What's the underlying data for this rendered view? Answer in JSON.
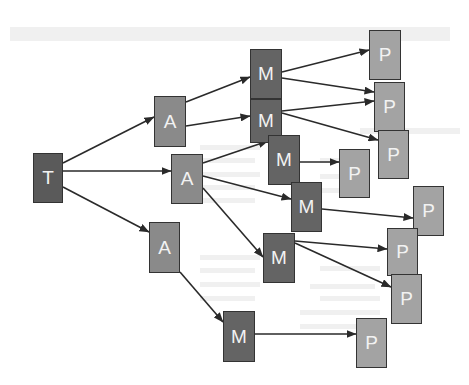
{
  "diagram": {
    "type": "tree-flow",
    "colors": {
      "T": "#5a5a5a",
      "A": "#8a8a8a",
      "M": "#646464",
      "P": "#a3a3a3",
      "border": "#333333",
      "edge": "#2a2a2a",
      "label": "#f2f2f2"
    },
    "nodes": [
      {
        "id": "T",
        "label": "T",
        "kind": "T",
        "x": 33,
        "y": 153,
        "w": 30,
        "h": 50
      },
      {
        "id": "A1",
        "label": "A",
        "kind": "A",
        "x": 154,
        "y": 96,
        "w": 32,
        "h": 51
      },
      {
        "id": "A2",
        "label": "A",
        "kind": "A",
        "x": 171,
        "y": 154,
        "w": 32,
        "h": 50
      },
      {
        "id": "A3",
        "label": "A",
        "kind": "A",
        "x": 149,
        "y": 222,
        "w": 31,
        "h": 51
      },
      {
        "id": "M1",
        "label": "M",
        "kind": "M",
        "x": 250,
        "y": 49,
        "w": 32,
        "h": 50
      },
      {
        "id": "M2",
        "label": "M",
        "kind": "M",
        "x": 250,
        "y": 99,
        "w": 32,
        "h": 44
      },
      {
        "id": "M3",
        "label": "M",
        "kind": "M",
        "x": 268,
        "y": 135,
        "w": 32,
        "h": 50
      },
      {
        "id": "M4",
        "label": "M",
        "kind": "M",
        "x": 291,
        "y": 182,
        "w": 31,
        "h": 50
      },
      {
        "id": "M5",
        "label": "M",
        "kind": "M",
        "x": 263,
        "y": 233,
        "w": 32,
        "h": 50
      },
      {
        "id": "M6",
        "label": "M",
        "kind": "M",
        "x": 223,
        "y": 311,
        "w": 32,
        "h": 51
      },
      {
        "id": "P1",
        "label": "P",
        "kind": "P",
        "x": 369,
        "y": 30,
        "w": 32,
        "h": 50
      },
      {
        "id": "P2",
        "label": "P",
        "kind": "P",
        "x": 374,
        "y": 82,
        "w": 31,
        "h": 50
      },
      {
        "id": "P3",
        "label": "P",
        "kind": "P",
        "x": 378,
        "y": 130,
        "w": 31,
        "h": 49
      },
      {
        "id": "P4",
        "label": "P",
        "kind": "P",
        "x": 339,
        "y": 149,
        "w": 31,
        "h": 49
      },
      {
        "id": "P5",
        "label": "P",
        "kind": "P",
        "x": 413,
        "y": 186,
        "w": 31,
        "h": 50
      },
      {
        "id": "P6",
        "label": "P",
        "kind": "P",
        "x": 387,
        "y": 228,
        "w": 31,
        "h": 48
      },
      {
        "id": "P7",
        "label": "P",
        "kind": "P",
        "x": 391,
        "y": 274,
        "w": 31,
        "h": 50
      },
      {
        "id": "P8",
        "label": "P",
        "kind": "P",
        "x": 356,
        "y": 318,
        "w": 31,
        "h": 50
      }
    ],
    "edges": [
      {
        "from": "T",
        "to": "A1",
        "x1": 63,
        "y1": 163,
        "x2": 154,
        "y2": 117
      },
      {
        "from": "T",
        "to": "A2",
        "x1": 63,
        "y1": 171,
        "x2": 171,
        "y2": 171
      },
      {
        "from": "T",
        "to": "A3",
        "x1": 63,
        "y1": 187,
        "x2": 149,
        "y2": 232
      },
      {
        "from": "A1",
        "to": "M1",
        "x1": 186,
        "y1": 102,
        "x2": 250,
        "y2": 77
      },
      {
        "from": "A1",
        "to": "M2",
        "x1": 186,
        "y1": 126,
        "x2": 250,
        "y2": 116
      },
      {
        "from": "A2",
        "to": "M3",
        "x1": 203,
        "y1": 163,
        "x2": 268,
        "y2": 141
      },
      {
        "from": "A2",
        "to": "M4",
        "x1": 203,
        "y1": 176,
        "x2": 291,
        "y2": 199
      },
      {
        "from": "A2",
        "to": "M5",
        "x1": 203,
        "y1": 188,
        "x2": 263,
        "y2": 257
      },
      {
        "from": "A3",
        "to": "M6",
        "x1": 180,
        "y1": 272,
        "x2": 223,
        "y2": 322
      },
      {
        "from": "M1",
        "to": "P1",
        "x1": 282,
        "y1": 72,
        "x2": 369,
        "y2": 50
      },
      {
        "from": "M1",
        "to": "P2",
        "x1": 282,
        "y1": 78,
        "x2": 374,
        "y2": 92
      },
      {
        "from": "M2",
        "to": "P2",
        "x1": 282,
        "y1": 111,
        "x2": 374,
        "y2": 101
      },
      {
        "from": "M2",
        "to": "P3",
        "x1": 282,
        "y1": 113,
        "x2": 378,
        "y2": 140
      },
      {
        "from": "M3",
        "to": "P4",
        "x1": 300,
        "y1": 162,
        "x2": 339,
        "y2": 162
      },
      {
        "from": "M4",
        "to": "P5",
        "x1": 322,
        "y1": 209,
        "x2": 413,
        "y2": 218
      },
      {
        "from": "M5",
        "to": "P6",
        "x1": 295,
        "y1": 241,
        "x2": 387,
        "y2": 249
      },
      {
        "from": "M5",
        "to": "P7",
        "x1": 295,
        "y1": 243,
        "x2": 391,
        "y2": 287
      },
      {
        "from": "M6",
        "to": "P8",
        "x1": 255,
        "y1": 334,
        "x2": 356,
        "y2": 334
      }
    ]
  },
  "ghost_text_lines": [
    {
      "x": 10,
      "y": 27,
      "w": 440,
      "h": 14
    },
    {
      "x": 360,
      "y": 128,
      "w": 100,
      "h": 6
    },
    {
      "x": 200,
      "y": 145,
      "w": 60,
      "h": 5
    },
    {
      "x": 200,
      "y": 158,
      "w": 55,
      "h": 5
    },
    {
      "x": 320,
      "y": 158,
      "w": 40,
      "h": 5
    },
    {
      "x": 200,
      "y": 172,
      "w": 60,
      "h": 5
    },
    {
      "x": 320,
      "y": 174,
      "w": 45,
      "h": 5
    },
    {
      "x": 200,
      "y": 185,
      "w": 55,
      "h": 5
    },
    {
      "x": 320,
      "y": 188,
      "w": 50,
      "h": 5
    },
    {
      "x": 200,
      "y": 198,
      "w": 55,
      "h": 5
    },
    {
      "x": 200,
      "y": 255,
      "w": 60,
      "h": 5
    },
    {
      "x": 200,
      "y": 268,
      "w": 55,
      "h": 5
    },
    {
      "x": 320,
      "y": 266,
      "w": 60,
      "h": 5
    },
    {
      "x": 200,
      "y": 282,
      "w": 60,
      "h": 5
    },
    {
      "x": 310,
      "y": 284,
      "w": 65,
      "h": 5
    },
    {
      "x": 200,
      "y": 296,
      "w": 55,
      "h": 5
    },
    {
      "x": 320,
      "y": 296,
      "w": 60,
      "h": 5
    },
    {
      "x": 300,
      "y": 310,
      "w": 80,
      "h": 5
    },
    {
      "x": 300,
      "y": 324,
      "w": 70,
      "h": 5
    }
  ]
}
